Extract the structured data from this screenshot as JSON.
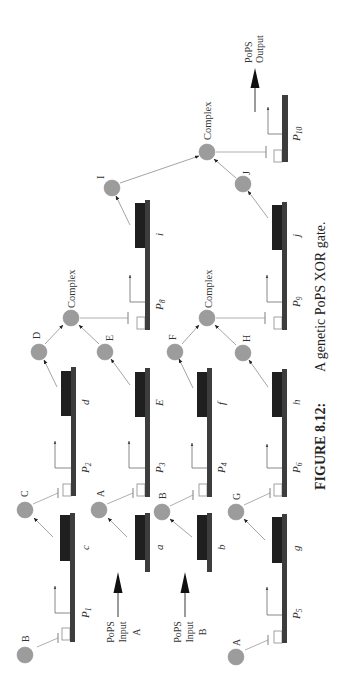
{
  "figure": {
    "caption": {
      "number": "FIGURE 8.12:",
      "text": "A genetic PoPS XOR gate."
    },
    "input_a": {
      "line1": "PoPS",
      "line2": "Input",
      "line3": "A"
    },
    "input_b": {
      "line1": "PoPS",
      "line2": "Input",
      "line3": "B"
    },
    "output": {
      "line1": "PoPS",
      "line2": "Output"
    },
    "promoters": {
      "p1": {
        "letter": "P",
        "sub": "1"
      },
      "p2": {
        "letter": "P",
        "sub": "2"
      },
      "p3": {
        "letter": "P",
        "sub": "3"
      },
      "p4": {
        "letter": "P",
        "sub": "4"
      },
      "p5": {
        "letter": "P",
        "sub": "5"
      },
      "p6": {
        "letter": "P",
        "sub": "6"
      },
      "p8": {
        "letter": "P",
        "sub": "8"
      },
      "p9": {
        "letter": "P",
        "sub": "9"
      },
      "p10": {
        "letter": "P",
        "sub": "10"
      }
    },
    "genes": {
      "c": "c",
      "d": "d",
      "a": "a",
      "e": "E",
      "i": "i",
      "b": "b",
      "f": "f",
      "g": "g",
      "h": "h",
      "j": "j"
    },
    "proteins": {
      "b1": "B",
      "c": "C",
      "d": "D",
      "a1": "A",
      "e": "E",
      "b2": "B",
      "f": "F",
      "a2": "A",
      "g": "G",
      "h": "H",
      "i": "I",
      "j": "J"
    },
    "complexes": {
      "de": "Complex",
      "fh": "Complex",
      "ij": "Complex"
    },
    "edges": {
      "produces": [
        [
          "c",
          "C"
        ],
        [
          "d",
          "D"
        ],
        [
          "a",
          "A"
        ],
        [
          "E",
          "E"
        ],
        [
          "b",
          "B"
        ],
        [
          "f",
          "F"
        ],
        [
          "g",
          "G"
        ],
        [
          "h",
          "H"
        ],
        [
          "i",
          "I"
        ],
        [
          "j",
          "J"
        ]
      ],
      "binds": [
        [
          "D",
          "Complex"
        ],
        [
          "E",
          "Complex"
        ],
        [
          "F",
          "Complex"
        ],
        [
          "H",
          "Complex"
        ],
        [
          "I",
          "Complex"
        ],
        [
          "J",
          "Complex"
        ]
      ],
      "represses": [
        [
          "B",
          "P1"
        ],
        [
          "C",
          "P2"
        ],
        [
          "A",
          "P3"
        ],
        [
          "B",
          "P4"
        ],
        [
          "A",
          "P5"
        ],
        [
          "G",
          "P6"
        ],
        [
          "Complex(D,E)",
          "P8"
        ],
        [
          "Complex(F,H)",
          "P9"
        ],
        [
          "Complex(I,J)",
          "P10"
        ]
      ],
      "inputs": [
        [
          "PoPS Input A",
          "a"
        ],
        [
          "PoPS Input B",
          "b"
        ]
      ],
      "output": [
        "P10",
        "PoPS Output"
      ]
    },
    "colors": {
      "protein_fill": "#9c9c9c",
      "dna_bar": "#3d3d3d",
      "gene_block": "#1f1f1f",
      "promoter_outline": "#8a8a8a",
      "link": "#9a9a9a",
      "text": "#333333"
    }
  }
}
